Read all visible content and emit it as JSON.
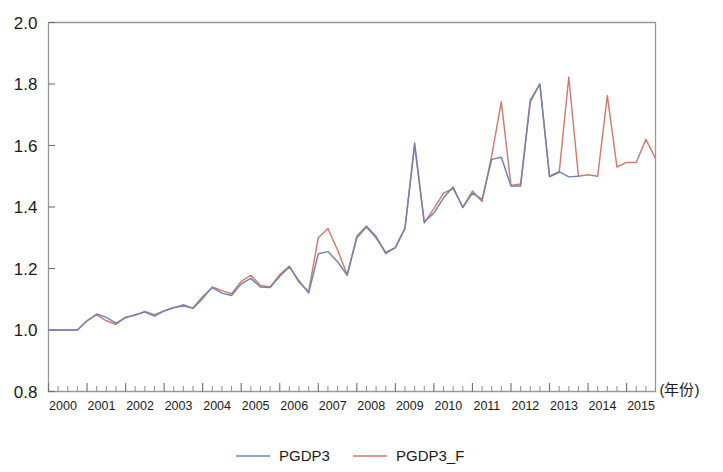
{
  "chart_data": {
    "type": "line",
    "title": "",
    "subtitle": "",
    "xlabel": "(年份)",
    "ylabel": "",
    "xlim": [
      2000,
      2015.75
    ],
    "ylim": [
      0.8,
      2.0
    ],
    "grid": false,
    "legend_position": "bottom",
    "x_tick_labels": [
      "2000",
      "2001",
      "2002",
      "2003",
      "2004",
      "2005",
      "2006",
      "2007",
      "2008",
      "2009",
      "2010",
      "2011",
      "2012",
      "2013",
      "2014",
      "2015"
    ],
    "y_tick_labels": [
      "0.8",
      "1.0",
      "1.2",
      "1.4",
      "1.6",
      "1.8",
      "2.0"
    ],
    "y_ticks": [
      0.8,
      1.0,
      1.2,
      1.4,
      1.6,
      1.8,
      2.0
    ],
    "minor_ticks_per_year": 4,
    "x_quarters": [
      "2000Q1",
      "2000Q2",
      "2000Q3",
      "2000Q4",
      "2001Q1",
      "2001Q2",
      "2001Q3",
      "2001Q4",
      "2002Q1",
      "2002Q2",
      "2002Q3",
      "2002Q4",
      "2003Q1",
      "2003Q2",
      "2003Q3",
      "2003Q4",
      "2004Q1",
      "2004Q2",
      "2004Q3",
      "2004Q4",
      "2005Q1",
      "2005Q2",
      "2005Q3",
      "2005Q4",
      "2006Q1",
      "2006Q2",
      "2006Q3",
      "2006Q4",
      "2007Q1",
      "2007Q2",
      "2007Q3",
      "2007Q4",
      "2008Q1",
      "2008Q2",
      "2008Q3",
      "2008Q4",
      "2009Q1",
      "2009Q2",
      "2009Q3",
      "2009Q4",
      "2010Q1",
      "2010Q2",
      "2010Q3",
      "2010Q4",
      "2011Q1",
      "2011Q2",
      "2011Q3",
      "2011Q4",
      "2012Q1",
      "2012Q2",
      "2012Q3",
      "2012Q4",
      "2013Q1",
      "2013Q2",
      "2013Q3",
      "2013Q4",
      "2014Q1",
      "2014Q2",
      "2014Q3",
      "2014Q4",
      "2015Q1",
      "2015Q2",
      "2015Q3",
      "2015Q4"
    ],
    "series": [
      {
        "name": "PGDP3",
        "color": "#6d84b4",
        "values": [
          1.0,
          1.0,
          1.0,
          1.0,
          1.03,
          1.052,
          1.041,
          1.022,
          1.04,
          1.05,
          1.058,
          1.045,
          1.062,
          1.073,
          1.078,
          1.072,
          1.108,
          1.138,
          1.12,
          1.112,
          1.15,
          1.168,
          1.14,
          1.138,
          1.175,
          1.205,
          1.16,
          1.12,
          1.248,
          1.255,
          1.222,
          1.178,
          1.3,
          1.335,
          1.3,
          1.252,
          1.268,
          1.33,
          1.608,
          1.352,
          1.38,
          1.43,
          1.465,
          1.398,
          1.445,
          1.425,
          1.555,
          1.562,
          1.468,
          1.468,
          1.742,
          1.8,
          1.5,
          1.515,
          1.498,
          1.5,
          null,
          null,
          null,
          null,
          null,
          null,
          null,
          null
        ]
      },
      {
        "name": "PGDP3_F",
        "color": "#d47a6c",
        "values": [
          1.0,
          1.0,
          1.0,
          1.0,
          1.03,
          1.05,
          1.03,
          1.018,
          1.042,
          1.048,
          1.06,
          1.05,
          1.062,
          1.072,
          1.082,
          1.07,
          1.102,
          1.14,
          1.128,
          1.118,
          1.158,
          1.178,
          1.145,
          1.14,
          1.18,
          1.208,
          1.155,
          1.125,
          1.3,
          1.33,
          1.26,
          1.18,
          1.305,
          1.338,
          1.305,
          1.248,
          1.268,
          1.332,
          1.6,
          1.348,
          1.395,
          1.445,
          1.46,
          1.4,
          1.452,
          1.418,
          1.568,
          1.742,
          1.47,
          1.475,
          1.748,
          1.8,
          1.498,
          1.512,
          1.822,
          1.5,
          1.505,
          1.5,
          1.762,
          1.53,
          1.545,
          1.545,
          1.62,
          1.558
        ]
      }
    ]
  },
  "legend": {
    "items": [
      {
        "label": "PGDP3",
        "color": "#6d84b4"
      },
      {
        "label": "PGDP3_F",
        "color": "#d47a6c"
      }
    ]
  },
  "axis": {
    "x_caption": "(年份)"
  }
}
